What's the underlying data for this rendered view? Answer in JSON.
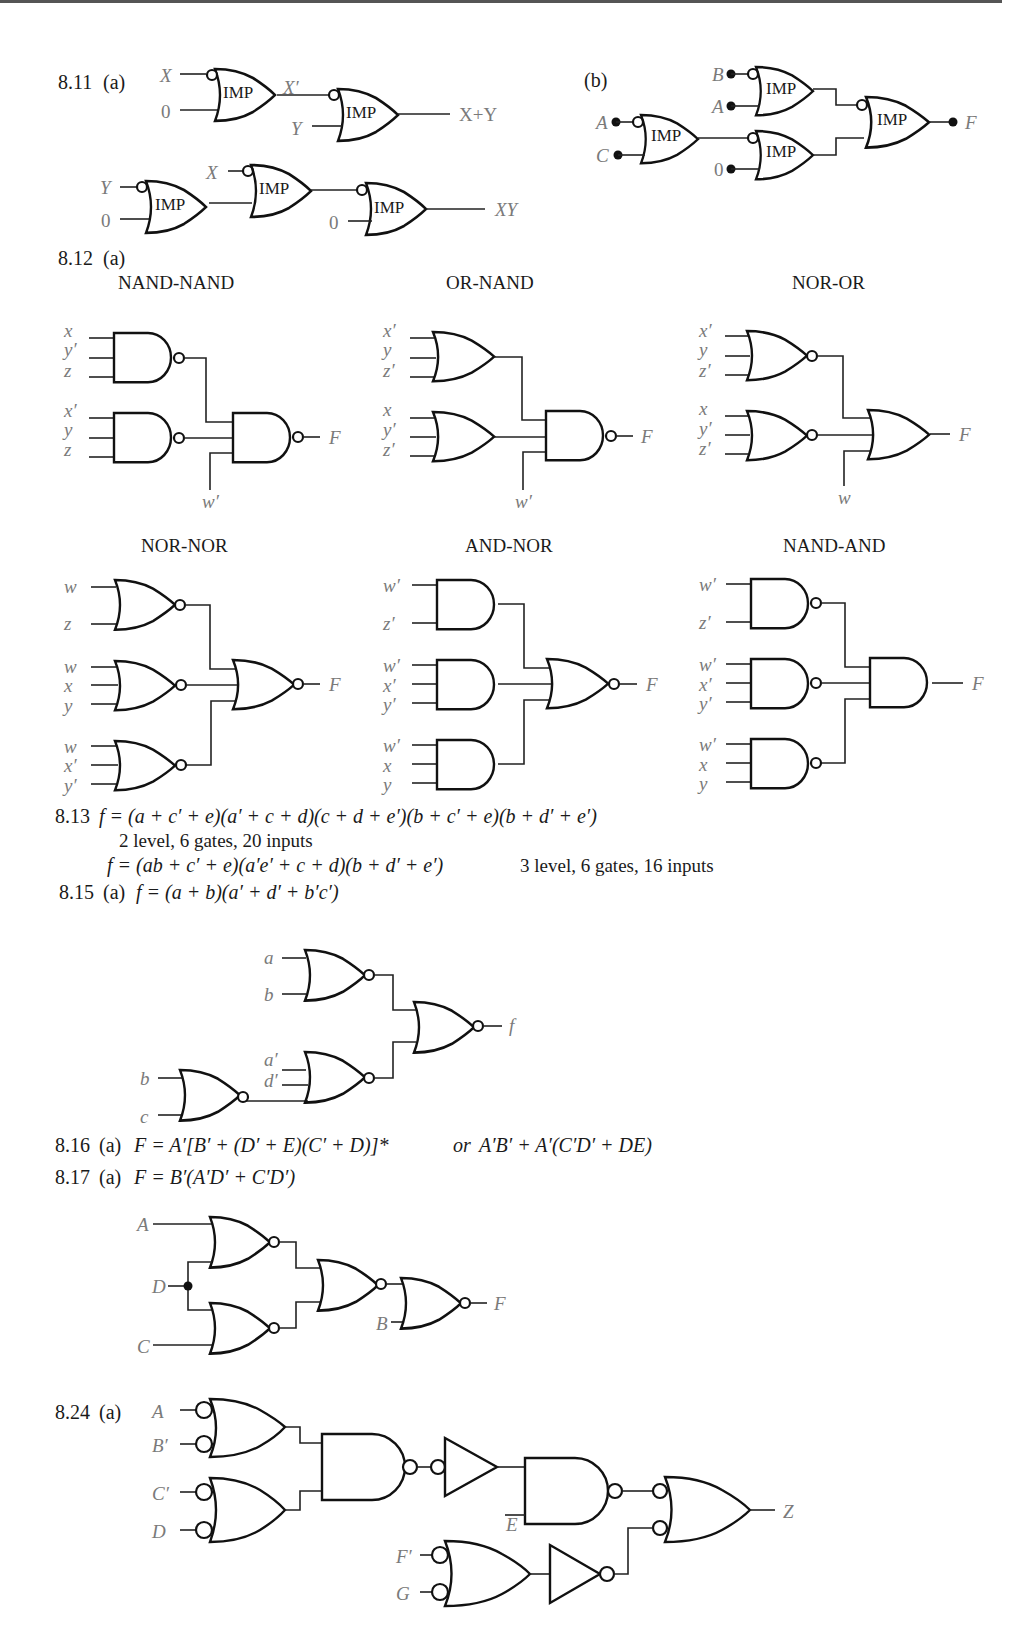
{
  "page": {
    "problems": {
      "p811": {
        "label": "8.11",
        "a": {
          "part": "(a)",
          "gate_label": "IMP",
          "circuit1": {
            "inputs": [
              "X",
              "0"
            ],
            "mid": "X′",
            "second_input": "Y",
            "output": "X+Y"
          },
          "circuit2": {
            "inputs": [
              "Y",
              "0"
            ],
            "second_input": "X",
            "third_input": "0",
            "output": "XY"
          }
        },
        "b": {
          "part": "(b)",
          "gate_label": "IMP",
          "inputs": [
            "B",
            "A",
            "A",
            "C",
            "0"
          ],
          "output": "F"
        }
      },
      "p812": {
        "label": "8.12",
        "part": "(a)",
        "diagrams": [
          {
            "title": "NAND-NAND",
            "inputs": [
              "x",
              "y′",
              "z",
              "x′",
              "y",
              "z"
            ],
            "extra": "w′",
            "output": "F"
          },
          {
            "title": "OR-NAND",
            "inputs": [
              "x′",
              "y",
              "z′",
              "x",
              "y′",
              "z′"
            ],
            "extra": "w′",
            "output": "F"
          },
          {
            "title": "NOR-OR",
            "inputs": [
              "x′",
              "y",
              "z′",
              "x",
              "y′",
              "z′"
            ],
            "extra": "w",
            "output": "F"
          },
          {
            "title": "NOR-NOR",
            "inputs": [
              "w",
              "z",
              "w",
              "x",
              "y",
              "w",
              "x′",
              "y′"
            ],
            "output": "F"
          },
          {
            "title": "AND-NOR",
            "inputs": [
              "w′",
              "z′",
              "w′",
              "x′",
              "y′",
              "w′",
              "x",
              "y"
            ],
            "output": "F"
          },
          {
            "title": "NAND-AND",
            "inputs": [
              "w′",
              "z′",
              "w′",
              "x′",
              "y′",
              "w′",
              "x",
              "y"
            ],
            "output": "F"
          }
        ]
      },
      "p813": {
        "label": "8.13",
        "line1": "f = (a + c′ + e)(a′ + c + d)(c + d + e′)(b + c′ + e)(b + d′ + e′)",
        "line2": "2 level, 6 gates, 20 inputs",
        "line3": "f = (ab + c′ + e)(a′e′ + c + d)(b + d′ + e′)",
        "line3_note": "3 level, 6 gates, 16 inputs"
      },
      "p815": {
        "label": "8.15",
        "part": "(a)",
        "equation": "f = (a + b)(a′ + d′ + b′c′)",
        "inputs": [
          "a",
          "b",
          "a′",
          "d′",
          "b",
          "c"
        ],
        "output": "f"
      },
      "p816": {
        "label": "8.16",
        "part": "(a)",
        "equation": "F = A′[B′ + (D′ + E)(C′ + D)]*",
        "or_word": "or",
        "equation_alt": "A′B′ + A′(C′D′ + DE)"
      },
      "p817": {
        "label": "8.17",
        "part": "(a)",
        "equation": "F = B′(A′D′ + C′D′)",
        "inputs": [
          "A",
          "D",
          "C",
          "B"
        ],
        "output": "F"
      },
      "p824": {
        "label": "8.24",
        "part": "(a)",
        "inputs": [
          "A",
          "B′",
          "C′",
          "D",
          "E",
          "F′",
          "G"
        ],
        "output": "Z"
      }
    }
  }
}
